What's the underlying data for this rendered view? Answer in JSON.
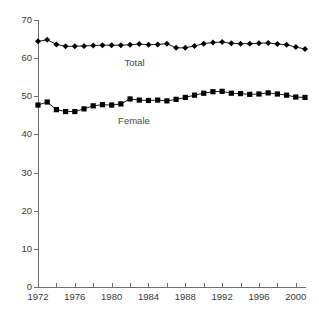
{
  "chart_data": {
    "type": "line",
    "title": "",
    "xlabel": "",
    "ylabel": "",
    "xlim": [
      1972,
      2001
    ],
    "ylim": [
      0,
      70
    ],
    "grid": false,
    "legend_position": "inline-annotation",
    "x": [
      1972,
      1973,
      1974,
      1975,
      1976,
      1977,
      1978,
      1979,
      1980,
      1981,
      1982,
      1983,
      1984,
      1985,
      1986,
      1987,
      1988,
      1989,
      1990,
      1991,
      1992,
      1993,
      1994,
      1995,
      1996,
      1997,
      1998,
      1999,
      2000,
      2001
    ],
    "xticks": [
      1972,
      1974,
      1976,
      1978,
      1980,
      1982,
      1984,
      1986,
      1988,
      1990,
      1992,
      1994,
      1996,
      1998,
      2000
    ],
    "xtick_labels": [
      "1972",
      "",
      "1976",
      "",
      "1980",
      "",
      "1984",
      "",
      "1988",
      "",
      "1992",
      "",
      "1996",
      "",
      "2000"
    ],
    "yticks": [
      0,
      10,
      20,
      30,
      40,
      50,
      60,
      70
    ],
    "ytick_labels": [
      "0",
      "10",
      "20",
      "30",
      "40",
      "50",
      "60",
      "70"
    ],
    "series": [
      {
        "name": "Total",
        "marker": "diamond",
        "color": "#000000",
        "label_text": "Total",
        "values": [
          64.4,
          64.8,
          63.6,
          63.1,
          63.1,
          63.2,
          63.3,
          63.4,
          63.4,
          63.4,
          63.5,
          63.7,
          63.5,
          63.6,
          63.8,
          62.7,
          62.7,
          63.2,
          63.8,
          64.1,
          64.2,
          63.9,
          63.8,
          63.8,
          63.9,
          64.0,
          63.7,
          63.5,
          62.9,
          62.4
        ]
      },
      {
        "name": "Female",
        "marker": "square",
        "color": "#000000",
        "label_text": "Female",
        "values": [
          47.7,
          48.5,
          46.5,
          46.0,
          46.0,
          46.7,
          47.5,
          47.8,
          47.7,
          48.0,
          49.3,
          49.0,
          48.9,
          49.0,
          48.8,
          49.2,
          49.7,
          50.3,
          50.8,
          51.2,
          51.3,
          50.8,
          50.7,
          50.5,
          50.6,
          50.9,
          50.6,
          50.3,
          49.8,
          49.7
        ]
      }
    ],
    "annotations": [
      {
        "text": "Total",
        "x": 1981.4,
        "y": 58.6
      },
      {
        "text": "Female",
        "x": 1980.7,
        "y": 43.6
      }
    ]
  }
}
